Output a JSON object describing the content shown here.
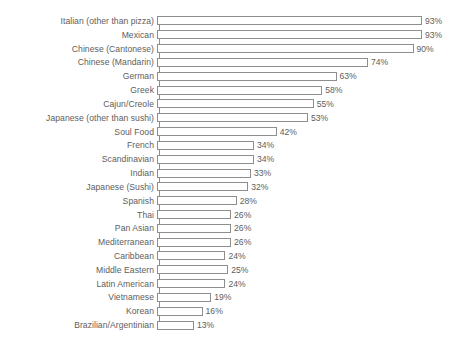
{
  "chart_data": {
    "type": "bar",
    "orientation": "horizontal",
    "title": "",
    "subtitle": "",
    "xlabel": "",
    "ylabel": "",
    "xlim": [
      0,
      100
    ],
    "grid": false,
    "legend": false,
    "value_suffix": "%",
    "categories": [
      "Italian (other than pizza)",
      "Mexican",
      "Chinese (Cantonese)",
      "Chinese (Mandarin)",
      "German",
      "Greek",
      "Cajun/Creole",
      "Japanese (other than sushi)",
      "Soul Food",
      "French",
      "Scandinavian",
      "Indian",
      "Japanese (Sushi)",
      "Spanish",
      "Thai",
      "Pan Asian",
      "Mediterranean",
      "Caribbean",
      "Middle Eastern",
      "Latin American",
      "Vietnamese",
      "Korean",
      "Brazilian/Argentinian"
    ],
    "values": [
      93,
      93,
      90,
      74,
      63,
      58,
      55,
      53,
      42,
      34,
      34,
      33,
      32,
      28,
      26,
      26,
      26,
      24,
      25,
      24,
      19,
      16,
      13
    ],
    "data_labels": [
      "93%",
      "93%",
      "90%",
      "74%",
      "63%",
      "58%",
      "55%",
      "53%",
      "42%",
      "34%",
      "34%",
      "33%",
      "32%",
      "28%",
      "26%",
      "26%",
      "26%",
      "24%",
      "25%",
      "24%",
      "19%",
      "16%",
      "13%"
    ],
    "rows": [
      {
        "label": "Italian (other than pizza)",
        "value": 93,
        "display": "93%"
      },
      {
        "label": "Mexican",
        "value": 93,
        "display": "93%"
      },
      {
        "label": "Chinese (Cantonese)",
        "value": 90,
        "display": "90%"
      },
      {
        "label": "Chinese (Mandarin)",
        "value": 74,
        "display": "74%"
      },
      {
        "label": "German",
        "value": 63,
        "display": "63%"
      },
      {
        "label": "Greek",
        "value": 58,
        "display": "58%"
      },
      {
        "label": "Cajun/Creole",
        "value": 55,
        "display": "55%"
      },
      {
        "label": "Japanese (other than sushi)",
        "value": 53,
        "display": "53%"
      },
      {
        "label": "Soul Food",
        "value": 42,
        "display": "42%"
      },
      {
        "label": "French",
        "value": 34,
        "display": "34%"
      },
      {
        "label": "Scandinavian",
        "value": 34,
        "display": "34%"
      },
      {
        "label": "Indian",
        "value": 33,
        "display": "33%"
      },
      {
        "label": "Japanese (Sushi)",
        "value": 32,
        "display": "32%"
      },
      {
        "label": "Spanish",
        "value": 28,
        "display": "28%"
      },
      {
        "label": "Thai",
        "value": 26,
        "display": "26%"
      },
      {
        "label": "Pan Asian",
        "value": 26,
        "display": "26%"
      },
      {
        "label": "Mediterranean",
        "value": 26,
        "display": "26%"
      },
      {
        "label": "Caribbean",
        "value": 24,
        "display": "24%"
      },
      {
        "label": "Middle Eastern",
        "value": 25,
        "display": "25%"
      },
      {
        "label": "Latin American",
        "value": 24,
        "display": "24%"
      },
      {
        "label": "Vietnamese",
        "value": 19,
        "display": "19%"
      },
      {
        "label": "Korean",
        "value": 16,
        "display": "16%"
      },
      {
        "label": "Brazilian/Argentinian",
        "value": 13,
        "display": "13%"
      }
    ]
  },
  "style": {
    "bar_fill": "#ffffff",
    "bar_stroke": "#8e8e8e",
    "text_color": "#5e5e5e",
    "background": "#ffffff",
    "px_per_percent": 2.85
  }
}
